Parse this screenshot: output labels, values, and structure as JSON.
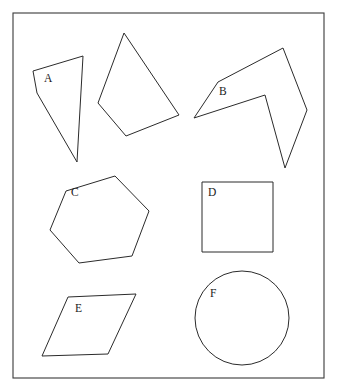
{
  "figure": {
    "background_color": "#ffffff",
    "stroke_color": "#2b2b2b",
    "label_color": "#1a1a1a",
    "frame": {
      "name": "outer-border",
      "x": 13,
      "y": 13,
      "width": 311,
      "height": 365,
      "stroke_color": "#3a3a3a"
    }
  },
  "shapes": [
    {
      "id": "A",
      "label": "A",
      "kind": "quadrilateral",
      "points": "33,71 83,56 77,162 37,93",
      "label_x": 44,
      "label_y": 82
    },
    {
      "id": "A2",
      "label": "",
      "kind": "quadrilateral",
      "points": "124,33 179,115 126,136 98,103",
      "label_x": 0,
      "label_y": 0
    },
    {
      "id": "B",
      "label": "B",
      "kind": "concave-hexagon",
      "points": "194,118 218,82 283,48 307,110 285,168 265,95",
      "label_x": 219,
      "label_y": 95
    },
    {
      "id": "C",
      "label": "C",
      "kind": "hexagon",
      "points": "66,191 115,176 149,211 132,256 79,263 50,230",
      "label_x": 71,
      "label_y": 196
    },
    {
      "id": "D",
      "label": "D",
      "kind": "square",
      "points": "202,182 273,182 273,252 202,252",
      "label_x": 208,
      "label_y": 196
    },
    {
      "id": "E",
      "label": "E",
      "kind": "parallelogram",
      "points": "68,297 136,294 108,354 42,356",
      "label_x": 75,
      "label_y": 312
    },
    {
      "id": "F",
      "label": "F",
      "kind": "circle",
      "cx": 242,
      "cy": 318,
      "r": 47,
      "label_x": 210,
      "label_y": 297
    }
  ],
  "chart_data": {
    "type": "diagram",
    "xlabel": "",
    "ylabel": "",
    "categories": [
      "A",
      "B",
      "C",
      "D",
      "E",
      "F"
    ],
    "items": [
      {
        "label": "A",
        "shape": "quadrilateral",
        "sides": 4,
        "convex": false,
        "position": "top-left",
        "note": "dart-like quadrilateral overlapping an unlabeled quadrilateral"
      },
      {
        "label": "B",
        "shape": "concave polygon",
        "sides": 6,
        "convex": false,
        "position": "top-right",
        "note": "arrow / chevron-like hexagon with a deep notch"
      },
      {
        "label": "C",
        "shape": "hexagon",
        "sides": 6,
        "convex": true,
        "position": "middle-left",
        "note": "irregular convex hexagon"
      },
      {
        "label": "D",
        "shape": "square",
        "sides": 4,
        "convex": true,
        "position": "middle-right",
        "note": "axis-aligned square"
      },
      {
        "label": "E",
        "shape": "parallelogram",
        "sides": 4,
        "convex": true,
        "position": "bottom-left",
        "note": "slanted parallelogram"
      },
      {
        "label": "F",
        "shape": "circle",
        "sides": 0,
        "convex": true,
        "position": "bottom-right",
        "note": "circle of radius about 47 px"
      }
    ],
    "unlabeled_count": 1,
    "labeled_count": 6,
    "total_shapes": 7
  }
}
